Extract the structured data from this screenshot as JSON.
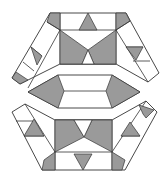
{
  "figure": {
    "colors": {
      "background": "#ffffff",
      "shade": "#9a9a9a",
      "stroke": "#333333"
    },
    "pieces": [
      {
        "id": "top-piece",
        "label": ""
      },
      {
        "id": "middle-piece",
        "label": ""
      },
      {
        "id": "bottom-piece",
        "label": ""
      }
    ]
  }
}
